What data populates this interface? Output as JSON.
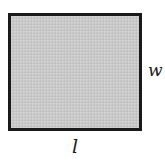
{
  "diagram": {
    "shape": "rectangle",
    "fill_color": "#c9c9c9",
    "border_color": "#1a1a1a",
    "labels": {
      "width": "w",
      "length": "l"
    }
  }
}
